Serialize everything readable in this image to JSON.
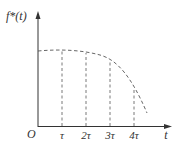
{
  "diagram": {
    "y_axis_label": "f*(t)",
    "x_axis_label": "t",
    "origin_label": "O",
    "ticks": [
      {
        "label": "τ",
        "x": 62
      },
      {
        "label": "2τ",
        "x": 86
      },
      {
        "label": "3τ",
        "x": 110
      },
      {
        "label": "4τ",
        "x": 134
      }
    ],
    "curve_points": [
      [
        38,
        51
      ],
      [
        62,
        51
      ],
      [
        86,
        53
      ],
      [
        110,
        60
      ],
      [
        134,
        89
      ],
      [
        147,
        113
      ]
    ],
    "colors": {
      "axis": "#333333",
      "curve": "#555555"
    }
  }
}
